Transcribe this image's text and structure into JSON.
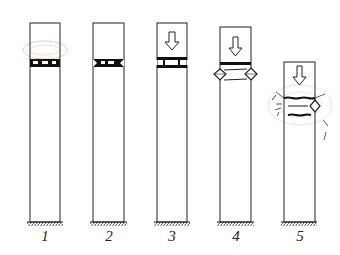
{
  "diagram": {
    "type": "stage-sequence",
    "stages": [
      {
        "label": "1",
        "x": 30,
        "top": 23,
        "load_arrow": false,
        "state": "intact band with openings, faint halo"
      },
      {
        "label": "2",
        "x": 93,
        "top": 23,
        "load_arrow": false,
        "state": "band with small notches at edges"
      },
      {
        "label": "3",
        "x": 157,
        "top": 23,
        "load_arrow": true,
        "state": "gap opens, two bars with posts"
      },
      {
        "label": "4",
        "x": 220,
        "top": 27,
        "load_arrow": true,
        "state": "bulging diamonds at both sides"
      },
      {
        "label": "5",
        "x": 284,
        "top": 62,
        "load_arrow": true,
        "state": "cracking with fragments flying"
      }
    ],
    "ground_y": 222,
    "column_width": 30,
    "colors": {
      "stroke": "#222222",
      "halo": "#f0c8b8",
      "background": "#ffffff"
    }
  }
}
